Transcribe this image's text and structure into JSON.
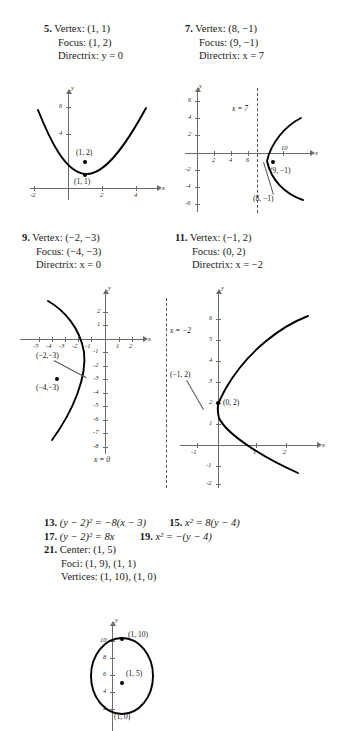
{
  "problems": [
    {
      "number": "5.",
      "lines": [
        "Vertex: (1, 1)",
        "Focus: (1, 2)",
        "Directrix: y = 0"
      ],
      "graph": {
        "axis_x_label": "x",
        "axis_y_label": "y",
        "x_ticks": [
          "-2",
          "2",
          "4"
        ],
        "y_ticks": [
          "4",
          "6"
        ],
        "points": [
          {
            "label": "(1, 2)",
            "coord": [
              1,
              2
            ]
          },
          {
            "label": "(1, 1)",
            "coord": [
              1,
              1
            ]
          }
        ],
        "curve_type": "parabola-up",
        "vertex": [
          1,
          1
        ]
      }
    },
    {
      "number": "7.",
      "lines": [
        "Vertex: (8, −1)",
        "Focus: (9, −1)",
        "Directrix: x = 7"
      ],
      "graph": {
        "axis_x_label": "x",
        "axis_y_label": "y",
        "x_ticks": [
          "2",
          "4",
          "6",
          "10"
        ],
        "y_ticks": [
          "6",
          "4",
          "2",
          "-2",
          "-4",
          "-6"
        ],
        "directrix_label": "x = 7",
        "directrix_value": 7,
        "points": [
          {
            "label": "(9, −1)",
            "coord": [
              9,
              -1
            ]
          },
          {
            "label": "(8, −1)",
            "coord": [
              8,
              -1
            ]
          }
        ],
        "curve_type": "parabola-right",
        "vertex": [
          8,
          -1
        ]
      }
    },
    {
      "number": "9.",
      "lines": [
        "Vertex: (−2, −3)",
        "Focus: (−4, −3)",
        "Directrix: x = 0"
      ],
      "graph": {
        "axis_x_label": "x",
        "axis_y_label": "y",
        "x_ticks": [
          "-5",
          "-4",
          "-3",
          "-2",
          "-1",
          "1",
          "2"
        ],
        "y_ticks": [
          "2",
          "1",
          "-1",
          "-2",
          "-3",
          "-4",
          "-5",
          "-6",
          "-7",
          "-8"
        ],
        "directrix_label": "x = 0",
        "directrix_value": 0,
        "points": [
          {
            "label": "(−2,−3)",
            "coord": [
              -2,
              -3
            ]
          },
          {
            "label": "(−4,−3)",
            "coord": [
              -4,
              -3
            ]
          }
        ],
        "curve_type": "parabola-left",
        "vertex": [
          -2,
          -3
        ]
      }
    },
    {
      "number": "11.",
      "lines": [
        "Vertex: (−1, 2)",
        "Focus: (0, 2)",
        "Directrix: x = −2"
      ],
      "graph": {
        "axis_x_label": "x",
        "axis_y_label": "y",
        "x_ticks": [
          "-1",
          "1",
          "2"
        ],
        "y_ticks": [
          "6",
          "5",
          "4",
          "3",
          "2",
          "1",
          "-1",
          "-2"
        ],
        "directrix_label": "x = −2",
        "directrix_value": -2,
        "points": [
          {
            "label": "(−1, 2)",
            "coord": [
              -1,
              2
            ]
          },
          {
            "label": "(0, 2)",
            "coord": [
              0,
              2
            ]
          }
        ],
        "curve_type": "parabola-right",
        "vertex": [
          -1,
          2
        ]
      }
    }
  ],
  "answers": {
    "row1": [
      {
        "number": "13.",
        "text": "(y − 2)² = −8(x − 3)"
      },
      {
        "number": "15.",
        "text": "x² = 8(y − 4)"
      }
    ],
    "row2": [
      {
        "number": "17.",
        "text": "(y − 2)² = 8x"
      },
      {
        "number": "19.",
        "text": "x² = −(y − 4)"
      }
    ]
  },
  "problem21": {
    "number": "21.",
    "lines": [
      "Center: (1, 5)",
      "Foci: (1, 9), (1, 1)",
      "Vertices: (1, 10), (1, 0)"
    ],
    "graph": {
      "axis_x_label": "x",
      "axis_y_label": "y",
      "y_ticks": [
        "10",
        "8",
        "6",
        "4",
        "2"
      ],
      "points": [
        {
          "label": "(1, 10)",
          "coord": [
            1,
            10
          ]
        },
        {
          "label": "(1, 5)",
          "coord": [
            1,
            5
          ]
        },
        {
          "label": "(1, 0)",
          "coord": [
            1,
            0
          ]
        }
      ],
      "curve_type": "ellipse",
      "center": [
        1,
        5
      ]
    }
  },
  "colors": {
    "axis": "#6b6b6b",
    "curve": "#000000",
    "text": "#1a1a1a",
    "dashed": "#555555"
  }
}
